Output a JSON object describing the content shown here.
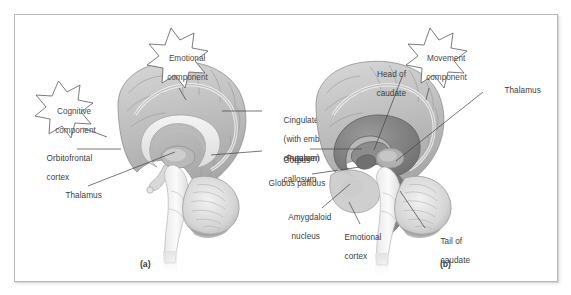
{
  "figure": {
    "background_color": "#ffffff",
    "frame_color": "#b7b7b7",
    "text_color": "#3d3d3d",
    "leader_color": "#4a4a4a"
  },
  "panel_a": {
    "caption": "(a)",
    "image_name": "midsagittal-brain-limbic",
    "callouts": [
      {
        "name": "cognitive-component",
        "text": "Cognitive\ncomponent",
        "line1": "Cognitive",
        "line2": "component"
      },
      {
        "name": "emotional-component",
        "text": "Emotional\ncomponent",
        "line1": "Emotional",
        "line2": "component"
      }
    ],
    "labels": [
      {
        "name": "cingulate-gyrus",
        "line1": "Cingulate gyrus",
        "line2": "(with embedded",
        "line3": "cingulum)"
      },
      {
        "name": "corpus-callosum",
        "line1": "Corpus",
        "line2": "callosum"
      },
      {
        "name": "orbitofrontal-cortex",
        "line1": "Orbitofrontal",
        "line2": "cortex"
      },
      {
        "name": "thalamus",
        "line1": "Thalamus",
        "line2": ""
      }
    ]
  },
  "panel_b": {
    "caption": "(b)",
    "image_name": "midsagittal-brain-basal-ganglia",
    "callouts": [
      {
        "name": "movement-component",
        "text": "Movement\ncomponent",
        "line1": "Movement",
        "line2": "component"
      }
    ],
    "labels": [
      {
        "name": "head-of-caudate",
        "line1": "Head of",
        "line2": "caudate"
      },
      {
        "name": "thalamus",
        "line1": "Thalamus",
        "line2": ""
      },
      {
        "name": "putamen",
        "line1": "Putamen",
        "line2": ""
      },
      {
        "name": "globus-pallidus",
        "line1": "Globus pallidus",
        "line2": ""
      },
      {
        "name": "amygdaloid-nucleus",
        "line1": "Amygdaloid",
        "line2": "nucleus"
      },
      {
        "name": "emotional-cortex",
        "line1": "Emotional",
        "line2": "cortex"
      },
      {
        "name": "tail-of-caudate",
        "line1": "Tail of",
        "line2": "caudate"
      }
    ]
  }
}
